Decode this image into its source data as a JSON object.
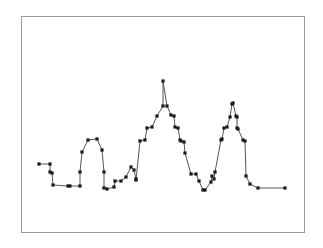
{
  "figure": {
    "background_color": "#ffffff",
    "frame": {
      "x": 21,
      "y": 16,
      "width": 284,
      "height": 217,
      "border_color": "#9a9a9a",
      "border_width": 1,
      "fill": "#ffffff"
    }
  },
  "chart_data": {
    "type": "line",
    "title": "",
    "subtitle": "",
    "xlabel": "",
    "ylabel": "",
    "grid": false,
    "legend": null,
    "axes_visible": false,
    "tick_labels_x": [],
    "tick_labels_y": [],
    "xlim": [
      0,
      323
    ],
    "ylim": [
      248,
      0
    ],
    "marker": {
      "shape": "square",
      "size": 3.2,
      "color": "#1a1a1a"
    },
    "line": {
      "color": "#555555",
      "width": 1.0,
      "style": "solid"
    },
    "series": [
      {
        "name": "silhouette-profile",
        "x": [
          39,
          50,
          50,
          52,
          53,
          68,
          70,
          80,
          80,
          82,
          88,
          97,
          102,
          104,
          104,
          107,
          114,
          115,
          121,
          126,
          131,
          134,
          136,
          136,
          140,
          145,
          147,
          152,
          157,
          163,
          163,
          167,
          171,
          174,
          175,
          178,
          180,
          181,
          184,
          185,
          191,
          196,
          199,
          203,
          205,
          211,
          212,
          214,
          215,
          221,
          222,
          224,
          227,
          230,
          232,
          233,
          236,
          237,
          237,
          238,
          243,
          245,
          246,
          250,
          258,
          285
        ],
        "y": [
          164,
          164,
          172,
          173,
          185,
          186,
          186,
          186,
          172,
          152,
          140,
          139,
          150,
          172,
          188,
          189,
          187,
          181,
          181,
          177,
          167,
          170,
          179,
          180,
          141,
          140,
          128,
          127,
          116,
          106,
          81,
          106,
          115,
          116,
          127,
          128,
          140,
          141,
          142,
          153,
          174,
          174,
          181,
          190,
          190,
          182,
          176,
          179,
          172,
          140,
          139,
          128,
          127,
          117,
          104,
          103,
          116,
          117,
          128,
          129,
          140,
          141,
          176,
          184,
          188,
          188
        ]
      }
    ],
    "point_count": 66
  }
}
